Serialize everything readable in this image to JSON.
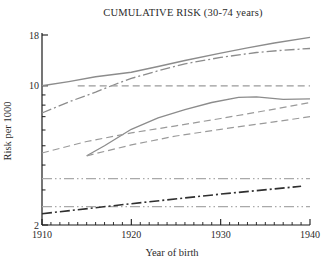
{
  "chart_data": {
    "type": "line",
    "title": "CUMULATIVE RISK (30-74 years)",
    "xlabel": "Year of birth",
    "ylabel": "Risk per 1000",
    "x_range": [
      1910,
      1940
    ],
    "y_range": [
      2,
      18
    ],
    "y_scale": "log",
    "grid": false,
    "legend": "none",
    "x_ticks_major": [
      1910,
      1920,
      1930,
      1940
    ],
    "x_minor_step": 1,
    "y_ticks_major": [
      2,
      10,
      18
    ],
    "y_ticks_minor": [
      3,
      4,
      5,
      6,
      7,
      8,
      9
    ],
    "colors": {
      "axis": "#1a1a1a",
      "gray_line": "#8c8c8c",
      "light_gray_line": "#a9a9a9",
      "dark_line": "#2f2f2f"
    },
    "series": [
      {
        "id": "upper-solid-line",
        "line_style": "solid",
        "color": "#8c8c8c",
        "width": 1.4,
        "points": [
          [
            1910,
            10.0
          ],
          [
            1913,
            10.5
          ],
          [
            1916,
            11.1
          ],
          [
            1920,
            11.7
          ],
          [
            1923,
            12.5
          ],
          [
            1926,
            13.4
          ],
          [
            1930,
            14.6
          ],
          [
            1933,
            15.5
          ],
          [
            1936,
            16.4
          ],
          [
            1940,
            17.5
          ]
        ]
      },
      {
        "id": "upper-dashdot-line",
        "line_style": "dashdot",
        "color": "#8c8c8c",
        "width": 1.3,
        "points": [
          [
            1910,
            7.3
          ],
          [
            1913,
            8.3
          ],
          [
            1916,
            9.3
          ],
          [
            1918,
            10.1
          ],
          [
            1920,
            10.9
          ],
          [
            1923,
            11.9
          ],
          [
            1926,
            12.9
          ],
          [
            1930,
            13.9
          ],
          [
            1934,
            14.7
          ],
          [
            1937,
            15.1
          ],
          [
            1940,
            15.4
          ]
        ]
      },
      {
        "id": "flat-dashed-line-at-10",
        "line_style": "dashed",
        "color": "#9a9a9a",
        "width": 1.2,
        "points": [
          [
            1914,
            10.0
          ],
          [
            1940,
            10.0
          ]
        ]
      },
      {
        "id": "middle-solid-line",
        "line_style": "solid",
        "color": "#8c8c8c",
        "width": 1.3,
        "points": [
          [
            1915,
            4.45
          ],
          [
            1917,
            5.0
          ],
          [
            1920,
            6.05
          ],
          [
            1923,
            6.9
          ],
          [
            1926,
            7.6
          ],
          [
            1929,
            8.25
          ],
          [
            1932,
            8.75
          ],
          [
            1934,
            8.8
          ],
          [
            1937,
            8.55
          ],
          [
            1940,
            8.6
          ]
        ]
      },
      {
        "id": "middle-upper-dashed-line",
        "line_style": "dashed",
        "color": "#9a9a9a",
        "width": 1.2,
        "points": [
          [
            1910,
            4.6
          ],
          [
            1915,
            5.25
          ],
          [
            1920,
            5.8
          ],
          [
            1925,
            6.3
          ],
          [
            1930,
            6.85
          ],
          [
            1935,
            7.5
          ],
          [
            1940,
            8.25
          ]
        ]
      },
      {
        "id": "middle-lower-dashed-line",
        "line_style": "dashed",
        "color": "#9a9a9a",
        "width": 1.2,
        "points": [
          [
            1915,
            4.45
          ],
          [
            1920,
            5.05
          ],
          [
            1925,
            5.6
          ],
          [
            1930,
            6.05
          ],
          [
            1935,
            6.5
          ],
          [
            1940,
            7.0
          ]
        ]
      },
      {
        "id": "lower-flat-dashdotdot-upper",
        "line_style": "dashdotdot",
        "color": "#a9a9a9",
        "width": 1.2,
        "points": [
          [
            1910,
            3.42
          ],
          [
            1940,
            3.42
          ]
        ]
      },
      {
        "id": "lower-flat-dashdotdot-lower",
        "line_style": "dashdotdot",
        "color": "#a9a9a9",
        "width": 1.2,
        "points": [
          [
            1910,
            2.47
          ],
          [
            1940,
            2.47
          ]
        ]
      },
      {
        "id": "lower-rising-dark-dashdot-line",
        "line_style": "dashdot",
        "color": "#2f2f2f",
        "width": 1.6,
        "points": [
          [
            1910,
            2.28
          ],
          [
            1920,
            2.56
          ],
          [
            1930,
            2.86
          ],
          [
            1939,
            3.13
          ]
        ]
      }
    ]
  }
}
